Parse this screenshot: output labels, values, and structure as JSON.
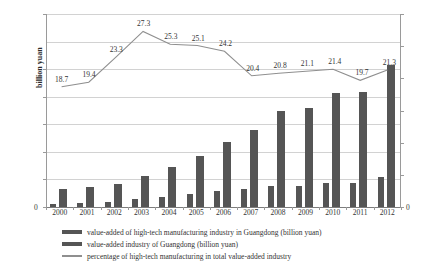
{
  "chart_data": {
    "type": "bar",
    "title": "",
    "categories": [
      "2000",
      "2001",
      "2002",
      "2003",
      "2004",
      "2005",
      "2006",
      "2007",
      "2008",
      "2009",
      "2010",
      "2011",
      "2012"
    ],
    "series": [
      {
        "name": "value-added of high-tech manufacturing industry in Guangdong (billion yuan)",
        "type": "bar",
        "axis": "left",
        "values": [
          62,
          70,
          98,
          140,
          185,
          232,
          290,
          330,
          375,
          380,
          435,
          440,
          540
        ]
      },
      {
        "name": "value-added industry of Guangdong (billion yuan)",
        "type": "bar",
        "axis": "left",
        "values": [
          330,
          360,
          420,
          560,
          725,
          925,
          1170,
          1395,
          1745,
          1790,
          2060,
          2090,
          2570
        ]
      },
      {
        "name": "percentage of high-tech manufacturing in total value-added industry",
        "type": "line",
        "axis": "right",
        "values": [
          18.7,
          19.4,
          23.3,
          27.3,
          25.3,
          25.1,
          24.2,
          20.4,
          20.8,
          21.1,
          21.4,
          19.7,
          21.3
        ]
      }
    ],
    "xlabel": "",
    "ylabel": "billion yuan",
    "y2label": "%",
    "ylim": [
      0,
      3500
    ],
    "y2lim": [
      0,
      30
    ],
    "yticks": [
      0,
      500,
      1000,
      1500,
      2000,
      2500,
      3500
    ],
    "y2ticks": [
      0,
      5,
      10,
      15,
      20,
      25,
      30
    ],
    "grid": true,
    "legend_position": "bottom"
  },
  "axes": {
    "left_title": "billion yuan",
    "right_unit": "%",
    "left_ticks": [
      "3500",
      "2500",
      "2000",
      "1500",
      "1000",
      "500",
      "0"
    ],
    "right_ticks": [
      "30",
      "25",
      "20",
      "15",
      "10",
      "5",
      "0"
    ]
  },
  "legend": {
    "items": [
      {
        "marker": "bar-swatch",
        "label": "value-added of high-tech manufacturing industry in Guangdong (billion yuan)"
      },
      {
        "marker": "bar-swatch",
        "label": "value-added industry of Guangdong (billion yuan)"
      },
      {
        "marker": "line-swatch",
        "label": "percentage of high-tech manufacturing in total value-added industry"
      }
    ]
  },
  "colors": {
    "bar": "#555555",
    "line": "#8f8f8f",
    "grid": "#d2d2d2",
    "axis": "#9a9a9a"
  }
}
